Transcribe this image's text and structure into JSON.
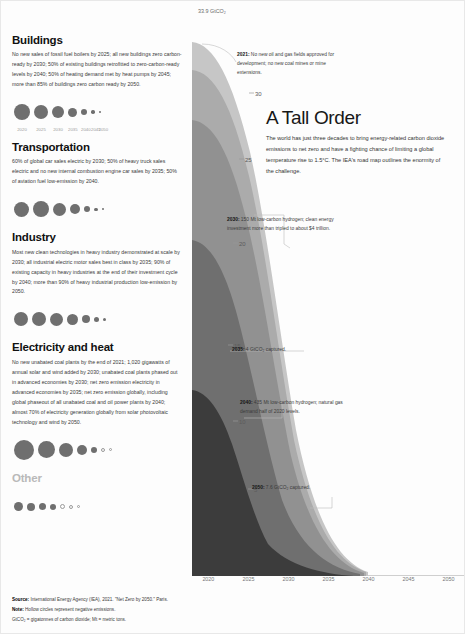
{
  "sectors": [
    {
      "name": "buildings",
      "title": "Buildings",
      "body": "No new sales of fossil fuel boilers by 2025; all new buildings zero carbon-ready by 2030; 50% of existing buildings retrofitted to zero-carbon-ready levels by 2040; 50% of heating demand met by heat pumps by 2045; more than 85% of buildings zero carbon ready by 2050.",
      "dot_sizes": [
        16,
        14,
        12,
        9,
        6,
        3.5,
        2
      ],
      "dot_years": [
        "2020",
        "2025",
        "2030",
        "2035",
        "2040",
        "2045",
        "2050"
      ]
    },
    {
      "name": "transportation",
      "title": "Transportation",
      "body": "60% of global car sales electric by 2030; 50% of heavy truck sales electric and no new internal combustion engine car sales by 2035; 50% of aviation fuel low-emission by 2040.",
      "dot_sizes": [
        15,
        16,
        13,
        10,
        6,
        3.5,
        2
      ],
      "dot_years": [
        "2020",
        "2025",
        "2030",
        "2035",
        "2040",
        "2045",
        "2050"
      ]
    },
    {
      "name": "industry",
      "title": "Industry",
      "body": "Most new clean technologies in heavy industry demonstrated at scale by 2030; all industrial electric motor sales best in class by 2035; 90% of existing capacity in heavy industries at the end of their investment cycle by 2040; more than 90% of heavy industrial production low-emission by 2050.",
      "dot_sizes": [
        14,
        14,
        13,
        11,
        8,
        5,
        3
      ],
      "dot_years": [
        "2020",
        "2025",
        "2030",
        "2035",
        "2040",
        "2045",
        "2050"
      ]
    },
    {
      "name": "electricity-and-heat",
      "title": "Electricity and heat",
      "body": "No new unabated coal plants by the end of 2021; 1,020 gigawatts of annual solar and wind added by 2030; unabated coal plants phased out in advanced economies by 2030; net zero emission electricity in advanced economies by 2035; net zero emission globally, including global phaseout of all unabated coal and oil power plants by 2040; almost 70% of electricity generation globally from solar photovoltaic technology and wind by 2050.",
      "dot_sizes": [
        20,
        17,
        14,
        10,
        6,
        4,
        3
      ],
      "dot_years": [
        "2020",
        "2025",
        "2030",
        "2035",
        "2040",
        "2045",
        "2050"
      ],
      "hollow_from": 5
    },
    {
      "name": "other",
      "title": "Other",
      "muted": true,
      "body": "",
      "dot_sizes": [
        9,
        8,
        7,
        6,
        5,
        4,
        3
      ],
      "dot_years": [],
      "hollow_from": 4
    }
  ],
  "chart_top_label": "33.9 GtCO₂",
  "headline": {
    "title": "A Tall Order",
    "paragraph": "The world has just three decades to bring energy-related carbon dioxide emissions to net zero and have a fighting chance of limiting a global temperature rise to 1.5°C. The IEA's road map outlines the enormity of the challenge."
  },
  "annotations": [
    {
      "name": "anno-2021",
      "year": "2021:",
      "text": " No new oil and gas fields approved for development; no new coal mines or mine extensions."
    },
    {
      "name": "anno-2030",
      "year": "2030:",
      "text": " 150 Mt low-carbon hydrogen; clean energy investment more than tripled to about $4 trillion."
    },
    {
      "name": "anno-2035",
      "year": "2035:",
      "text": " 4 GtCO₂ captured."
    },
    {
      "name": "anno-2040",
      "year": "2040:",
      "text": " 435 Mt low-carbon hydrogen; natural gas demand half of 2020 levels."
    },
    {
      "name": "anno-2050",
      "year": "2050:",
      "text": " 7.6 GtCO₂ captured."
    }
  ],
  "footer": {
    "source_label": "Source:",
    "source_text": " International Energy Agency (IEA), 2021. \"Net Zero by 2050.\" Paris.",
    "note_label": "Note:",
    "note_text": " Hollow circles represent negative emissions.",
    "abbrev": "GtCO₂ = gigatonnes of carbon dioxide; Mt = metric tons."
  },
  "chart_data": {
    "type": "area",
    "title": "A Tall Order",
    "stacked": true,
    "xlabel": "",
    "ylabel": "GtCO₂",
    "xlim": [
      2020,
      2050
    ],
    "ylim": [
      0,
      35
    ],
    "x_ticks": [
      2020,
      2025,
      2030,
      2035,
      2040,
      2045,
      2050
    ],
    "y_axis_labels": [
      {
        "value": 30,
        "label": "30"
      },
      {
        "value": 25,
        "label": "25"
      },
      {
        "value": 20,
        "label": "20"
      },
      {
        "value": 15,
        "label": "15"
      },
      {
        "value": 10,
        "label": "10"
      },
      {
        "value": 5,
        "label": "5"
      }
    ],
    "total_label": "33.9 GtCO₂",
    "x": [
      2020,
      2025,
      2030,
      2035,
      2040,
      2045,
      2050
    ],
    "series": [
      {
        "name": "Electricity and heat",
        "color": "#3a3a3a",
        "values": [
          13.5,
          10.0,
          5.8,
          2.4,
          0.4,
          -0.3,
          -0.8
        ]
      },
      {
        "name": "Industry",
        "color": "#6e6e6e",
        "values": [
          8.5,
          7.3,
          5.6,
          3.6,
          2.0,
          1.0,
          0.5
        ]
      },
      {
        "name": "Transportation",
        "color": "#8f8f8f",
        "values": [
          7.2,
          6.4,
          4.8,
          3.0,
          1.6,
          0.8,
          0.4
        ]
      },
      {
        "name": "Buildings",
        "color": "#a8a8a8",
        "values": [
          3.0,
          2.5,
          1.8,
          1.1,
          0.6,
          0.3,
          0.15
        ]
      },
      {
        "name": "Other",
        "color": "#c4c4c4",
        "values": [
          1.7,
          1.4,
          1.0,
          0.6,
          0.35,
          0.2,
          0.1
        ]
      }
    ],
    "totals": [
      33.9,
      27.6,
      19.0,
      10.7,
      4.95,
      2.0,
      0.35
    ]
  }
}
